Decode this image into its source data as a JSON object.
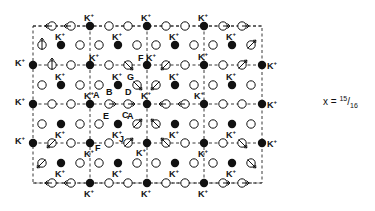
{
  "figure": {
    "x_label": "x = ",
    "x_num": "15",
    "x_den": "16",
    "ion_label": "K",
    "ion_charge": "+",
    "colors": {
      "ink": "#111111",
      "background": "#ffffff"
    },
    "frame": {
      "x0": 33,
      "x1": 262,
      "y0": 26,
      "y1": 183
    },
    "main_rows_y": [
      26,
      65,
      104,
      143,
      183
    ],
    "mid_rows_y": [
      45,
      85,
      124,
      163
    ],
    "cell_lines_x": [
      90,
      147,
      204
    ],
    "cell_lines_y": [
      104
    ]
  },
  "sites": [
    {
      "x": 90,
      "y": 26,
      "t": "K",
      "l": "K+",
      "lp": "t"
    },
    {
      "x": 147,
      "y": 26,
      "t": "K",
      "l": "K+",
      "lp": "t"
    },
    {
      "x": 204,
      "y": 26,
      "t": "K",
      "l": "K+",
      "lp": "t"
    },
    {
      "x": 52,
      "y": 26,
      "t": "h",
      "d": "left"
    },
    {
      "x": 71,
      "y": 26,
      "t": "h",
      "d": "left"
    },
    {
      "x": 109,
      "y": 26,
      "t": "o"
    },
    {
      "x": 128,
      "y": 26,
      "t": "o"
    },
    {
      "x": 166,
      "y": 26,
      "t": "o"
    },
    {
      "x": 185,
      "y": 26,
      "t": "o"
    },
    {
      "x": 223,
      "y": 26,
      "t": "h",
      "d": "right"
    },
    {
      "x": 242,
      "y": 26,
      "t": "h",
      "d": "right"
    },
    {
      "x": 42,
      "y": 45,
      "t": "s",
      "d": "up"
    },
    {
      "x": 61,
      "y": 45,
      "t": "K",
      "l": "K+",
      "lp": "t"
    },
    {
      "x": 80,
      "y": 45,
      "t": "o"
    },
    {
      "x": 99,
      "y": 45,
      "t": "o"
    },
    {
      "x": 118,
      "y": 45,
      "t": "K",
      "l": "K+",
      "lp": "t"
    },
    {
      "x": 137,
      "y": 45,
      "t": "o"
    },
    {
      "x": 156,
      "y": 45,
      "t": "o"
    },
    {
      "x": 175,
      "y": 45,
      "t": "K",
      "l": "K+",
      "lp": "t"
    },
    {
      "x": 194,
      "y": 45,
      "t": "o"
    },
    {
      "x": 213,
      "y": 45,
      "t": "o"
    },
    {
      "x": 232,
      "y": 45,
      "t": "K",
      "l": "K+",
      "lp": "t"
    },
    {
      "x": 251,
      "y": 45,
      "t": "s",
      "d": "upright"
    },
    {
      "x": 33,
      "y": 65,
      "t": "K",
      "l": "K+",
      "lp": "l"
    },
    {
      "x": 90,
      "y": 65,
      "t": "K",
      "l": "K+",
      "lp": "tr"
    },
    {
      "x": 147,
      "y": 65,
      "t": "K",
      "l": "K+",
      "lp": "tr",
      "pre": "F"
    },
    {
      "x": 204,
      "y": 65,
      "t": "K",
      "l": "K+",
      "lp": "t"
    },
    {
      "x": 262,
      "y": 65,
      "t": "K",
      "l": "K+",
      "lp": "r"
    },
    {
      "x": 52,
      "y": 65,
      "t": "s",
      "d": "up"
    },
    {
      "x": 71,
      "y": 65,
      "t": "o"
    },
    {
      "x": 109,
      "y": 65,
      "t": "o"
    },
    {
      "x": 128,
      "y": 65,
      "t": "s",
      "d": "downright"
    },
    {
      "x": 166,
      "y": 65,
      "t": "s",
      "d": "downleft"
    },
    {
      "x": 185,
      "y": 65,
      "t": "o"
    },
    {
      "x": 223,
      "y": 65,
      "t": "o"
    },
    {
      "x": 242,
      "y": 65,
      "t": "s",
      "d": "upright"
    },
    {
      "x": 42,
      "y": 85,
      "t": "o"
    },
    {
      "x": 61,
      "y": 85,
      "t": "K",
      "l": "K+",
      "lp": "t"
    },
    {
      "x": 80,
      "y": 85,
      "t": "o"
    },
    {
      "x": 99,
      "y": 85,
      "t": "o"
    },
    {
      "x": 118,
      "y": 85,
      "t": "K",
      "l": "K+",
      "lp": "t"
    },
    {
      "x": 137,
      "y": 85,
      "t": "s",
      "d": "downright",
      "tag": "G"
    },
    {
      "x": 156,
      "y": 85,
      "t": "s",
      "d": "downleft"
    },
    {
      "x": 175,
      "y": 85,
      "t": "K",
      "l": "K+",
      "lp": "t"
    },
    {
      "x": 194,
      "y": 85,
      "t": "o"
    },
    {
      "x": 213,
      "y": 85,
      "t": "o"
    },
    {
      "x": 232,
      "y": 85,
      "t": "K",
      "l": "K+",
      "lp": "t"
    },
    {
      "x": 251,
      "y": 85,
      "t": "o"
    },
    {
      "x": 33,
      "y": 104,
      "t": "K",
      "l": "K+",
      "lp": "l"
    },
    {
      "x": 90,
      "y": 104,
      "t": "K",
      "l": "K+",
      "lp": "t",
      "tag": "A"
    },
    {
      "x": 147,
      "y": 104,
      "t": "K",
      "l": "K+",
      "lp": "t"
    },
    {
      "x": 204,
      "y": 104,
      "t": "K",
      "l": "K+",
      "lp": "tl"
    },
    {
      "x": 262,
      "y": 104,
      "t": "K",
      "l": "K+",
      "lp": "r"
    },
    {
      "x": 52,
      "y": 104,
      "t": "o"
    },
    {
      "x": 71,
      "y": 104,
      "t": "o"
    },
    {
      "x": 109,
      "y": 104,
      "t": "h",
      "d": "right",
      "tag": "B"
    },
    {
      "x": 128,
      "y": 104,
      "t": "h",
      "d": "right",
      "tag": "D"
    },
    {
      "x": 166,
      "y": 104,
      "t": "h",
      "d": "left"
    },
    {
      "x": 185,
      "y": 104,
      "t": "h",
      "d": "left"
    },
    {
      "x": 223,
      "y": 104,
      "t": "o"
    },
    {
      "x": 242,
      "y": 104,
      "t": "o"
    },
    {
      "x": 42,
      "y": 124,
      "t": "o"
    },
    {
      "x": 61,
      "y": 124,
      "t": "K",
      "l": "K+",
      "lp": "b"
    },
    {
      "x": 80,
      "y": 124,
      "t": "o"
    },
    {
      "x": 99,
      "y": 124,
      "t": "o",
      "tag": "E"
    },
    {
      "x": 118,
      "y": 124,
      "t": "K",
      "l": "K+",
      "lp": "b",
      "tag": "C"
    },
    {
      "x": 137,
      "y": 124,
      "t": "s",
      "d": "upright",
      "tag": "A"
    },
    {
      "x": 156,
      "y": 124,
      "t": "s",
      "d": "upleft"
    },
    {
      "x": 175,
      "y": 124,
      "t": "K",
      "l": "K+",
      "lp": "b"
    },
    {
      "x": 194,
      "y": 124,
      "t": "o"
    },
    {
      "x": 213,
      "y": 124,
      "t": "o"
    },
    {
      "x": 232,
      "y": 124,
      "t": "K",
      "l": "K+",
      "lp": "b"
    },
    {
      "x": 251,
      "y": 124,
      "t": "o"
    },
    {
      "x": 33,
      "y": 143,
      "t": "K",
      "l": "K+",
      "lp": "l"
    },
    {
      "x": 90,
      "y": 143,
      "t": "K",
      "l": "K+",
      "lp": "b",
      "tag": "F"
    },
    {
      "x": 147,
      "y": 143,
      "t": "K",
      "l": "K+",
      "lp": "bl"
    },
    {
      "x": 204,
      "y": 143,
      "t": "K",
      "l": "K+",
      "lp": "b"
    },
    {
      "x": 262,
      "y": 143,
      "t": "K",
      "l": "K+",
      "lp": "r"
    },
    {
      "x": 52,
      "y": 143,
      "t": "s",
      "d": "downleft"
    },
    {
      "x": 71,
      "y": 143,
      "t": "o"
    },
    {
      "x": 109,
      "y": 143,
      "t": "o"
    },
    {
      "x": 128,
      "y": 143,
      "t": "s",
      "d": "upright",
      "tag": "J"
    },
    {
      "x": 166,
      "y": 143,
      "t": "s",
      "d": "upleft"
    },
    {
      "x": 185,
      "y": 143,
      "t": "o"
    },
    {
      "x": 223,
      "y": 143,
      "t": "o"
    },
    {
      "x": 242,
      "y": 143,
      "t": "s",
      "d": "downright"
    },
    {
      "x": 42,
      "y": 163,
      "t": "s",
      "d": "downleft"
    },
    {
      "x": 61,
      "y": 163,
      "t": "K",
      "l": "K+",
      "lp": "b"
    },
    {
      "x": 80,
      "y": 163,
      "t": "o"
    },
    {
      "x": 99,
      "y": 163,
      "t": "o"
    },
    {
      "x": 118,
      "y": 163,
      "t": "K",
      "l": "K+",
      "lp": "b"
    },
    {
      "x": 137,
      "y": 163,
      "t": "o"
    },
    {
      "x": 156,
      "y": 163,
      "t": "o"
    },
    {
      "x": 175,
      "y": 163,
      "t": "K",
      "l": "K+",
      "lp": "b"
    },
    {
      "x": 194,
      "y": 163,
      "t": "o"
    },
    {
      "x": 213,
      "y": 163,
      "t": "o"
    },
    {
      "x": 232,
      "y": 163,
      "t": "K",
      "l": "K+",
      "lp": "b"
    },
    {
      "x": 251,
      "y": 163,
      "t": "s",
      "d": "downright"
    },
    {
      "x": 90,
      "y": 183,
      "t": "K",
      "l": "K+",
      "lp": "b"
    },
    {
      "x": 147,
      "y": 183,
      "t": "K",
      "l": "K+",
      "lp": "b"
    },
    {
      "x": 204,
      "y": 183,
      "t": "K",
      "l": "K+",
      "lp": "b"
    },
    {
      "x": 52,
      "y": 183,
      "t": "h",
      "d": "left"
    },
    {
      "x": 71,
      "y": 183,
      "t": "h",
      "d": "left"
    },
    {
      "x": 109,
      "y": 183,
      "t": "o"
    },
    {
      "x": 128,
      "y": 183,
      "t": "o"
    },
    {
      "x": 166,
      "y": 183,
      "t": "o"
    },
    {
      "x": 185,
      "y": 183,
      "t": "o"
    },
    {
      "x": 223,
      "y": 183,
      "t": "h",
      "d": "right"
    },
    {
      "x": 242,
      "y": 183,
      "t": "h",
      "d": "right"
    }
  ]
}
